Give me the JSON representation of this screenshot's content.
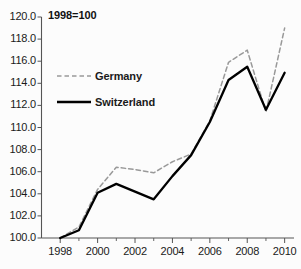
{
  "annotation": {
    "note": "1998=100"
  },
  "legend": {
    "germany_label": "Germany",
    "switzerland_label": "Switzerland",
    "position": "inside-upper-left"
  },
  "colors": {
    "germany_line": "#999999",
    "switzerland_line": "#000000",
    "axis": "#555555",
    "text": "#1a1a1a",
    "background": "#fcfcfc"
  },
  "chart_data": {
    "type": "line",
    "title": "",
    "subtitle": "",
    "annotation": "1998=100",
    "xlabel": "",
    "ylabel": "",
    "xlim": [
      1997,
      2010.5
    ],
    "ylim": [
      100.0,
      120.0
    ],
    "grid": false,
    "legend_position": "inside-upper-left",
    "x": [
      1998,
      1999,
      2000,
      2001,
      2002,
      2003,
      2004,
      2005,
      2006,
      2007,
      2008,
      2009,
      2010
    ],
    "yticks": [
      100.0,
      102.0,
      104.0,
      106.0,
      108.0,
      110.0,
      112.0,
      114.0,
      116.0,
      118.0,
      120.0
    ],
    "ytick_labels": [
      "100.0",
      "102.0",
      "104.0",
      "106.0",
      "108.0",
      "110.0",
      "112.0",
      "114.0",
      "116.0",
      "118.0",
      "120.0"
    ],
    "xticks": [
      1998,
      2000,
      2002,
      2004,
      2006,
      2008,
      2010
    ],
    "xtick_labels": [
      "1998",
      "2000",
      "2002",
      "2004",
      "2006",
      "2008",
      "2010"
    ],
    "xminor_ticks": [
      1999,
      2001,
      2003,
      2005,
      2007,
      2009
    ],
    "series": [
      {
        "name": "Germany",
        "style": "dashed",
        "color": "#999999",
        "values": [
          100.0,
          101.0,
          104.4,
          106.4,
          106.2,
          105.9,
          106.9,
          107.6,
          110.6,
          115.9,
          117.0,
          111.4,
          119.0
        ]
      },
      {
        "name": "Switzerland",
        "style": "solid",
        "color": "#000000",
        "values": [
          100.0,
          100.7,
          104.1,
          104.9,
          104.2,
          103.5,
          105.6,
          107.5,
          110.5,
          114.3,
          115.5,
          111.6,
          114.95
        ]
      }
    ]
  }
}
